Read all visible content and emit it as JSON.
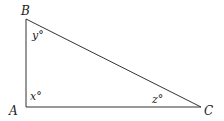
{
  "diagram": {
    "type": "right-triangle",
    "vertices": [
      {
        "name": "A",
        "label": "A"
      },
      {
        "name": "B",
        "label": "B"
      },
      {
        "name": "C",
        "label": "C"
      }
    ],
    "angles": [
      {
        "vertex": "A",
        "label": "x°"
      },
      {
        "vertex": "B",
        "label": "y°"
      },
      {
        "vertex": "C",
        "label": "z°"
      }
    ],
    "stroke_color": "#333333"
  }
}
